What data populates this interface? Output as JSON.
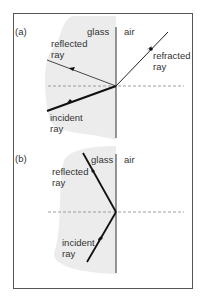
{
  "figure": {
    "panel_a": {
      "label": "(a)",
      "medium_left": "glass",
      "medium_right": "air",
      "reflected_label_1": "reflected",
      "reflected_label_2": "ray",
      "refracted_label_1": "refracted",
      "refracted_label_2": "ray",
      "incident_label_1": "incident",
      "incident_label_2": "ray"
    },
    "panel_b": {
      "label": "(b)",
      "medium_left": "glass",
      "medium_right": "air",
      "reflected_label_1": "reflected",
      "reflected_label_2": "ray",
      "incident_label_1": "incident",
      "incident_label_2": "ray"
    },
    "colors": {
      "glass_fill": "#ececec",
      "frame": "#555555",
      "ray": "#111111",
      "normal": "#888888"
    }
  }
}
